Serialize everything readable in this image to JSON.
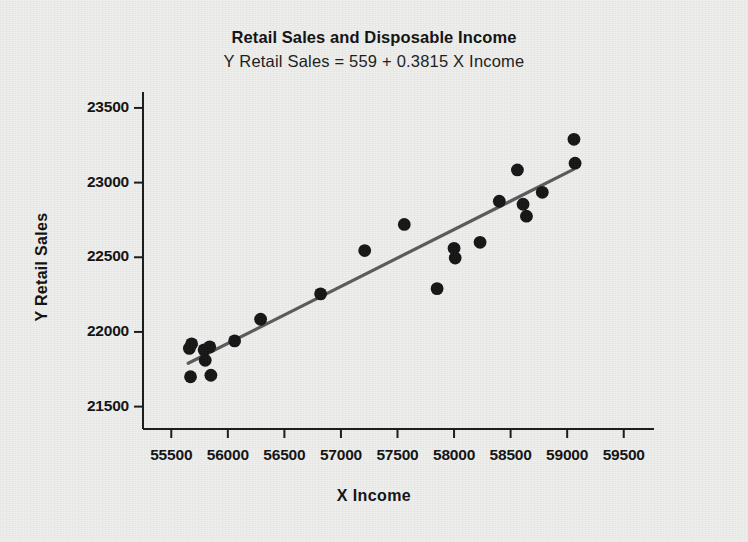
{
  "chart_data": {
    "type": "scatter",
    "title": "Retail Sales and Disposable Income",
    "subtitle": "Y Retail Sales = 559 + 0.3815 X Income",
    "xlabel": "X  Income",
    "ylabel": "Y Retail Sales",
    "xlim": [
      55250,
      59750
    ],
    "ylim": [
      21350,
      23600
    ],
    "xticks": [
      55500,
      56000,
      56500,
      57000,
      57500,
      58000,
      58500,
      59000,
      59500
    ],
    "xtick_labels": [
      "55500",
      "56000",
      "56500",
      "57000",
      "57500",
      "58000",
      "58500",
      "59000",
      "59500"
    ],
    "yticks": [
      21500,
      22000,
      22500,
      23000,
      23500
    ],
    "ytick_labels": [
      "21500",
      "22000",
      "22500",
      "23000",
      "23500"
    ],
    "grid": false,
    "legend": null,
    "marker_color": "#141414",
    "fit_line_color": "#5a5a5a",
    "axis_color": "#1a1a1a",
    "background_color": "#eeeeec",
    "fit_line": {
      "intercept": 559,
      "slope": 0.3815,
      "x_start": 55650,
      "x_end": 59060,
      "y_start": 21790,
      "y_end": 23090
    },
    "points": [
      {
        "x": 55660,
        "y": 21890
      },
      {
        "x": 55680,
        "y": 21920
      },
      {
        "x": 55670,
        "y": 21700
      },
      {
        "x": 55790,
        "y": 21880
      },
      {
        "x": 55800,
        "y": 21810
      },
      {
        "x": 55840,
        "y": 21900
      },
      {
        "x": 55850,
        "y": 21710
      },
      {
        "x": 56060,
        "y": 21940
      },
      {
        "x": 56290,
        "y": 22085
      },
      {
        "x": 56820,
        "y": 22255
      },
      {
        "x": 57210,
        "y": 22545
      },
      {
        "x": 57560,
        "y": 22720
      },
      {
        "x": 57850,
        "y": 22290
      },
      {
        "x": 58000,
        "y": 22560
      },
      {
        "x": 58010,
        "y": 22495
      },
      {
        "x": 58230,
        "y": 22600
      },
      {
        "x": 58400,
        "y": 22875
      },
      {
        "x": 58560,
        "y": 23085
      },
      {
        "x": 58610,
        "y": 22855
      },
      {
        "x": 58640,
        "y": 22775
      },
      {
        "x": 58780,
        "y": 22935
      },
      {
        "x": 59060,
        "y": 23290
      },
      {
        "x": 59070,
        "y": 23130
      }
    ]
  },
  "axis_titles": {
    "x": "X  Income",
    "y": "Y Retail Sales"
  },
  "titles": {
    "main": "Retail Sales and Disposable Income",
    "sub": "Y Retail Sales = 559 + 0.3815 X Income"
  }
}
